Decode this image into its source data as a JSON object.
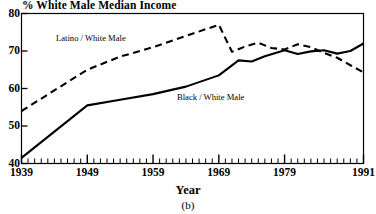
{
  "chart_data": {
    "type": "line",
    "title": "% White Male Median Income",
    "xlabel": "Year",
    "ylabel": "",
    "caption": "(b)",
    "xlim": [
      1939,
      1991
    ],
    "ylim": [
      40,
      80
    ],
    "grid": false,
    "legend_position": "inline-annotation",
    "xticks": [
      1939,
      1949,
      1959,
      1969,
      1979,
      1991
    ],
    "xtick_labels": [
      "1939",
      "1949",
      "1959",
      "1969",
      "1979",
      "1991"
    ],
    "minor_xtick_interval": 1,
    "yticks": [
      40,
      50,
      60,
      70,
      80
    ],
    "ytick_labels": [
      "40",
      "50",
      "60",
      "70",
      "80"
    ],
    "series": [
      {
        "name": "Latino / White Male",
        "style": "dashed",
        "color": "#000000",
        "x": [
          1939,
          1949,
          1954,
          1959,
          1964,
          1969,
          1971,
          1973,
          1975,
          1977,
          1979,
          1981,
          1983,
          1985,
          1987,
          1989,
          1991
        ],
        "values": [
          54.0,
          65.0,
          68.5,
          71.0,
          74.0,
          77.0,
          69.8,
          71.2,
          72.2,
          70.8,
          70.4,
          71.8,
          71.0,
          69.5,
          68.2,
          66.2,
          64.3
        ]
      },
      {
        "name": "Black / White Male",
        "style": "solid",
        "color": "#000000",
        "x": [
          1939,
          1949,
          1954,
          1959,
          1964,
          1969,
          1972,
          1974,
          1976,
          1979,
          1981,
          1983,
          1985,
          1987,
          1989,
          1991
        ],
        "values": [
          41.5,
          55.5,
          57.0,
          58.5,
          60.5,
          63.5,
          67.5,
          67.2,
          68.6,
          70.2,
          69.2,
          69.9,
          70.2,
          69.3,
          70.0,
          72.0
        ]
      }
    ]
  },
  "annotations": {
    "latino_label": "Latino / White Male",
    "black_label": "Black / White Male"
  }
}
